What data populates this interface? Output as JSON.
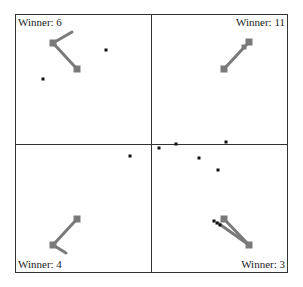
{
  "frame": {
    "x": 15,
    "y": 14,
    "w": 272,
    "h": 258,
    "center_x": 151,
    "center_y": 144,
    "stroke": "#333333"
  },
  "colors": {
    "shape": "#7a7a7a",
    "dot": "#111111",
    "border": "#333333",
    "background": "#ffffff"
  },
  "panels": [
    {
      "id": "top-left",
      "label": "Winner: 6",
      "label_pos": {
        "left": 18,
        "top": 16
      },
      "paths": [
        [
          [
            72,
            32
          ],
          [
            53,
            43
          ],
          [
            77,
            69
          ]
        ]
      ],
      "squares": [
        [
          53,
          43
        ],
        [
          77,
          69
        ]
      ],
      "dots": [
        [
          106,
          50
        ],
        [
          43,
          79
        ]
      ]
    },
    {
      "id": "top-right",
      "label": "Winner: 11",
      "label_pos": {
        "right": 18,
        "top": 16
      },
      "paths": [
        [
          [
            224,
            69
          ],
          [
            249,
            42
          ]
        ]
      ],
      "squares": [
        [
          224,
          69
        ],
        [
          249,
          42
        ],
        [
          244,
          47
        ]
      ],
      "dots": []
    },
    {
      "id": "bottom-left",
      "label": "Winner: 4",
      "label_pos": {
        "left": 18,
        "bottom": 18
      },
      "paths": [
        [
          [
            77,
            219
          ],
          [
            53,
            245
          ],
          [
            66,
            253
          ]
        ]
      ],
      "squares": [
        [
          77,
          219
        ],
        [
          53,
          245
        ]
      ],
      "dots": []
    },
    {
      "id": "bottom-right",
      "label": "Winner: 3",
      "label_pos": {
        "right": 18,
        "bottom": 18
      },
      "paths": [
        [
          [
            224,
            219
          ],
          [
            249,
            245
          ]
        ],
        [
          [
            218,
            223
          ],
          [
            249,
            245
          ]
        ]
      ],
      "squares": [
        [
          224,
          219
        ],
        [
          249,
          245
        ]
      ],
      "dots": [
        [
          214,
          221
        ],
        [
          217,
          223
        ],
        [
          220,
          225
        ]
      ]
    }
  ],
  "shared_dots": [
    [
      130,
      156
    ],
    [
      159,
      148
    ],
    [
      176,
      144
    ],
    [
      226,
      142
    ],
    [
      199,
      158
    ],
    [
      218,
      170
    ]
  ]
}
